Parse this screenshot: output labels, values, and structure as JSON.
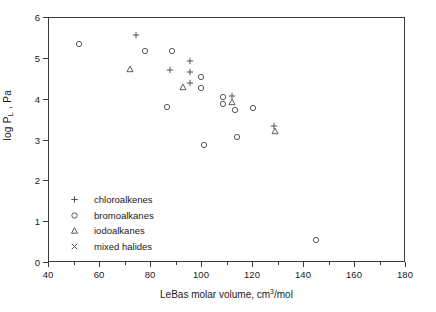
{
  "chart_data": {
    "type": "scatter",
    "title": "",
    "xlabel": "LeBas molar volume, cm3/mol",
    "xlabel_main": "LeBas molar volume, cm",
    "xlabel_sup": "3",
    "xlabel_tail": "/mol",
    "ylabel": "log PL , Pa",
    "ylabel_main": "log P",
    "ylabel_sub": "L",
    "ylabel_tail": " , Pa",
    "xlim": [
      40,
      180
    ],
    "ylim": [
      0,
      6
    ],
    "xticks": [
      40,
      60,
      80,
      100,
      120,
      140,
      160,
      180
    ],
    "xticks_minor": [
      50,
      70,
      90,
      110,
      130,
      150,
      170
    ],
    "yticks": [
      0,
      1,
      2,
      3,
      4,
      5,
      6
    ],
    "grid": false,
    "legend_position": "lower-left-inside",
    "marker_color": "#4a4a4a",
    "axis_color": "#3a3a3a",
    "series": [
      {
        "name": "chloroalkenes",
        "marker": "plus",
        "points": [
          [
            74.5,
            5.56
          ],
          [
            95.5,
            4.92
          ],
          [
            88.0,
            4.7
          ],
          [
            95.5,
            4.65
          ],
          [
            95.5,
            4.38
          ],
          [
            112.0,
            4.07
          ],
          [
            128.5,
            3.32
          ]
        ]
      },
      {
        "name": "bromoalkanes",
        "marker": "circle",
        "points": [
          [
            52.0,
            5.35
          ],
          [
            78.0,
            5.16
          ],
          [
            88.5,
            5.17
          ],
          [
            100.0,
            4.52
          ],
          [
            100.0,
            4.27
          ],
          [
            86.5,
            3.8
          ],
          [
            108.5,
            4.05
          ],
          [
            108.5,
            3.88
          ],
          [
            101.0,
            2.86
          ],
          [
            113.5,
            3.72
          ],
          [
            120.5,
            3.78
          ],
          [
            114.0,
            3.05
          ],
          [
            145.0,
            0.55
          ]
        ]
      },
      {
        "name": "iodoalkanes",
        "marker": "triangle",
        "points": [
          [
            72.0,
            4.73
          ],
          [
            93.0,
            4.29
          ],
          [
            112.0,
            3.93
          ],
          [
            129.0,
            3.22
          ]
        ]
      },
      {
        "name": "mixed halides",
        "marker": "cross",
        "points": []
      }
    ]
  },
  "legend": {
    "items": [
      {
        "marker": "plus",
        "label": "chloroalkenes"
      },
      {
        "marker": "circle",
        "label": "bromoalkanes"
      },
      {
        "marker": "triangle",
        "label": "iodoalkanes"
      },
      {
        "marker": "cross",
        "label": "mixed halides"
      }
    ]
  }
}
